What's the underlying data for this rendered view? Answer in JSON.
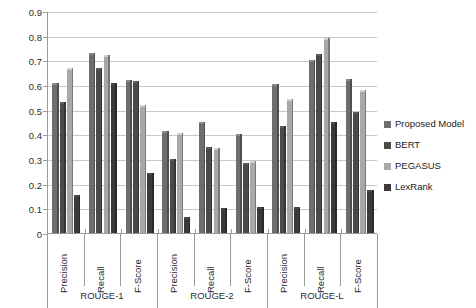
{
  "chart_data": {
    "type": "bar",
    "title": "",
    "subtitle": "",
    "xlabel": "",
    "ylabel": "",
    "ylim": [
      0,
      0.9
    ],
    "ytick_labels": [
      "0",
      "0.1",
      "0.2",
      "0.3",
      "0.4",
      "0.5",
      "0.6",
      "0.7",
      "0.8",
      "0.9"
    ],
    "ytick_values": [
      0,
      0.1,
      0.2,
      0.3,
      0.4,
      0.5,
      0.6,
      0.7,
      0.8,
      0.9
    ],
    "grid": true,
    "legend_position": "right",
    "categories": [
      "Precision",
      "Recall",
      "F-Score",
      "Precision",
      "Recall",
      "F-Score",
      "Precision",
      "Recall",
      "F-Score"
    ],
    "groups": [
      {
        "label": "ROUGE-1",
        "categories": [
          "Precision",
          "Recall",
          "F-Score"
        ]
      },
      {
        "label": "ROUGE-2",
        "categories": [
          "Precision",
          "Recall",
          "F-Score"
        ]
      },
      {
        "label": "ROUGE-L",
        "categories": [
          "Precision",
          "Recall",
          "F-Score"
        ]
      }
    ],
    "series": [
      {
        "name": "Proposed Model",
        "color": "#6e6e6e",
        "values": [
          0.61,
          0.73,
          0.62,
          0.415,
          0.45,
          0.4,
          0.605,
          0.7,
          0.625
        ]
      },
      {
        "name": "BERT",
        "color": "#4a4a4a",
        "values": [
          0.53,
          0.67,
          0.615,
          0.3,
          0.35,
          0.285,
          0.435,
          0.725,
          0.49
        ]
      },
      {
        "name": "PEGASUS",
        "color": "#a8a8a8",
        "values": [
          0.67,
          0.72,
          0.52,
          0.405,
          0.345,
          0.29,
          0.545,
          0.79,
          0.58
        ]
      },
      {
        "name": "LexRank",
        "color": "#3a3a3a",
        "values": [
          0.155,
          0.61,
          0.245,
          0.065,
          0.1,
          0.105,
          0.105,
          0.45,
          0.175
        ]
      }
    ]
  },
  "legend": {
    "items": [
      {
        "label": "Proposed Model",
        "color": "#6e6e6e"
      },
      {
        "label": "BERT",
        "color": "#4a4a4a"
      },
      {
        "label": "PEGASUS",
        "color": "#a8a8a8"
      },
      {
        "label": "LexRank",
        "color": "#3a3a3a"
      }
    ]
  }
}
